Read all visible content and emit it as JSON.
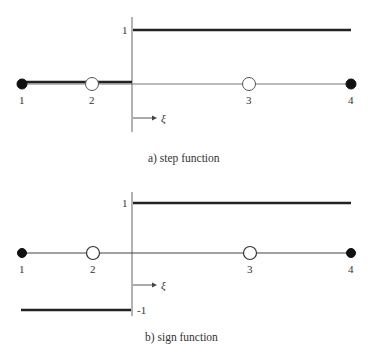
{
  "panels": [
    {
      "id": "a",
      "caption": "a) step function",
      "axis_value_high": "1",
      "axis_value_low": "",
      "xi_label": "ξ",
      "nodes": [
        {
          "label": "1",
          "type": "filled"
        },
        {
          "label": "2",
          "type": "open"
        },
        {
          "label": "3",
          "type": "open"
        },
        {
          "label": "4",
          "type": "filled"
        }
      ],
      "function": {
        "left_value": 0,
        "right_value": 1
      }
    },
    {
      "id": "b",
      "caption": "b) sign function",
      "axis_value_high": "1",
      "axis_value_low": "-1",
      "xi_label": "ξ",
      "nodes": [
        {
          "label": "1",
          "type": "filled"
        },
        {
          "label": "2",
          "type": "open"
        },
        {
          "label": "3",
          "type": "open"
        },
        {
          "label": "4",
          "type": "filled"
        }
      ],
      "function": {
        "left_value": -1,
        "right_value": 1
      }
    }
  ],
  "colors": {
    "thick_line": "#222222",
    "thin_line": "#666666",
    "node_fill": "#111111",
    "open_node_fill": "#ffffff"
  }
}
